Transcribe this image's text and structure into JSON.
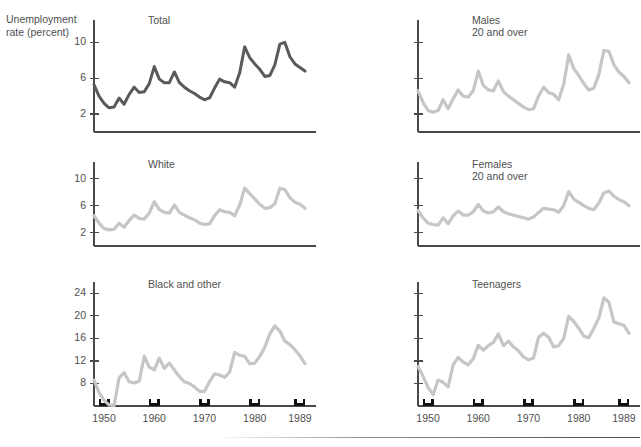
{
  "figure": {
    "axis_label": {
      "line1": "Unemployment",
      "line2": "rate (percent)"
    },
    "line_color_primary": "#5a5a5a",
    "line_color_secondary": "#c6c6c6",
    "axis_color": "#4a4a4a",
    "tick_marker_color": "#111111",
    "x_tick_labels": [
      "1950",
      "1960",
      "1970",
      "1980",
      "1989"
    ],
    "x_tick_years": [
      1950,
      1960,
      1970,
      1980,
      1989
    ]
  },
  "chart_data": [
    {
      "type": "line",
      "title": "Total",
      "xlabel": "",
      "ylabel": "Unemployment rate (percent)",
      "xlim": [
        1948,
        1991
      ],
      "ylim": [
        0,
        12.5
      ],
      "yticks": [
        2,
        6,
        10
      ],
      "ytick_labels": [
        "2",
        "6",
        "10"
      ],
      "xticks": [
        1950,
        1960,
        1970,
        1980,
        1989
      ],
      "xtick_labels": [],
      "grid": false,
      "legend": false,
      "color": "#5a5a5a",
      "x": [
        1948,
        1949,
        1950,
        1951,
        1952,
        1953,
        1954,
        1955,
        1956,
        1957,
        1958,
        1959,
        1960,
        1961,
        1962,
        1963,
        1964,
        1965,
        1966,
        1967,
        1968,
        1969,
        1970,
        1971,
        1972,
        1973,
        1974,
        1975,
        1976,
        1977,
        1978,
        1979,
        1980,
        1981,
        1982,
        1983,
        1984,
        1985,
        1986,
        1987,
        1988,
        1989,
        1990
      ],
      "values": [
        5.3,
        4.0,
        3.2,
        2.7,
        2.8,
        3.8,
        3.1,
        4.2,
        5.0,
        4.4,
        4.5,
        5.4,
        7.3,
        5.9,
        5.5,
        5.5,
        6.7,
        5.5,
        5.0,
        4.6,
        4.3,
        3.9,
        3.6,
        3.8,
        4.9,
        5.9,
        5.6,
        5.5,
        5.0,
        6.6,
        9.5,
        8.3,
        7.6,
        7.0,
        6.2,
        6.3,
        7.5,
        9.8,
        10.0,
        8.4,
        7.6,
        7.2,
        6.8,
        6.3,
        5.8
      ]
    },
    {
      "type": "line",
      "title": "Males\n20 and over",
      "xlabel": "",
      "ylabel": "",
      "xlim": [
        1948,
        1991
      ],
      "ylim": [
        0,
        12.5
      ],
      "yticks": [
        2,
        6,
        10
      ],
      "ytick_labels": [],
      "xticks": [
        1950,
        1960,
        1970,
        1980,
        1989
      ],
      "xtick_labels": [],
      "grid": false,
      "legend": false,
      "color": "#c6c6c6",
      "x": [
        1948,
        1949,
        1950,
        1951,
        1952,
        1953,
        1954,
        1955,
        1956,
        1957,
        1958,
        1959,
        1960,
        1961,
        1962,
        1963,
        1964,
        1965,
        1966,
        1967,
        1968,
        1969,
        1970,
        1971,
        1972,
        1973,
        1974,
        1975,
        1976,
        1977,
        1978,
        1979,
        1980,
        1981,
        1982,
        1983,
        1984,
        1985,
        1986,
        1987,
        1988,
        1989,
        1990
      ],
      "values": [
        4.6,
        3.3,
        2.4,
        2.2,
        2.4,
        3.6,
        2.6,
        3.7,
        4.7,
        4.0,
        3.9,
        4.6,
        6.8,
        5.2,
        4.7,
        4.6,
        5.7,
        4.5,
        4.0,
        3.6,
        3.2,
        2.8,
        2.5,
        2.6,
        4.0,
        5.0,
        4.4,
        4.2,
        3.6,
        5.3,
        8.6,
        7.1,
        6.3,
        5.4,
        4.7,
        4.9,
        6.4,
        9.1,
        9.0,
        7.5,
        6.7,
        6.2,
        5.5,
        5.0,
        4.8
      ]
    },
    {
      "type": "line",
      "title": "White",
      "xlabel": "",
      "ylabel": "",
      "xlim": [
        1948,
        1991
      ],
      "ylim": [
        0,
        12.5
      ],
      "yticks": [
        2,
        6,
        10
      ],
      "ytick_labels": [
        "2",
        "6",
        "10"
      ],
      "xticks": [
        1950,
        1960,
        1970,
        1980,
        1989
      ],
      "xtick_labels": [],
      "grid": false,
      "legend": false,
      "color": "#c6c6c6",
      "x": [
        1948,
        1949,
        1950,
        1951,
        1952,
        1953,
        1954,
        1955,
        1956,
        1957,
        1958,
        1959,
        1960,
        1961,
        1962,
        1963,
        1964,
        1965,
        1966,
        1967,
        1968,
        1969,
        1970,
        1971,
        1972,
        1973,
        1974,
        1975,
        1976,
        1977,
        1978,
        1979,
        1980,
        1981,
        1982,
        1983,
        1984,
        1985,
        1986,
        1987,
        1988,
        1989,
        1990
      ],
      "values": [
        4.5,
        3.4,
        2.6,
        2.4,
        2.5,
        3.4,
        2.8,
        3.8,
        4.6,
        4.1,
        4.0,
        4.9,
        6.6,
        5.4,
        5.0,
        4.9,
        6.1,
        5.0,
        4.6,
        4.2,
        3.9,
        3.4,
        3.2,
        3.3,
        4.5,
        5.4,
        5.1,
        5.0,
        4.5,
        6.1,
        8.6,
        7.8,
        7.0,
        6.2,
        5.6,
        5.7,
        6.3,
        8.6,
        8.4,
        7.2,
        6.5,
        6.2,
        5.6,
        5.3,
        4.7
      ]
    },
    {
      "type": "line",
      "title": "Females\n20 and over",
      "xlabel": "",
      "ylabel": "",
      "xlim": [
        1948,
        1991
      ],
      "ylim": [
        0,
        12.5
      ],
      "yticks": [
        2,
        6,
        10
      ],
      "ytick_labels": [],
      "xticks": [
        1950,
        1960,
        1970,
        1980,
        1989
      ],
      "xtick_labels": [],
      "grid": false,
      "legend": false,
      "color": "#c6c6c6",
      "x": [
        1948,
        1949,
        1950,
        1951,
        1952,
        1953,
        1954,
        1955,
        1956,
        1957,
        1958,
        1959,
        1960,
        1961,
        1962,
        1963,
        1964,
        1965,
        1966,
        1967,
        1968,
        1969,
        1970,
        1971,
        1972,
        1973,
        1974,
        1975,
        1976,
        1977,
        1978,
        1979,
        1980,
        1981,
        1982,
        1983,
        1984,
        1985,
        1986,
        1987,
        1988,
        1989,
        1990
      ],
      "values": [
        5.3,
        4.2,
        3.4,
        3.2,
        3.1,
        4.2,
        3.3,
        4.5,
        5.2,
        4.6,
        4.6,
        5.1,
        6.2,
        5.2,
        4.9,
        5.1,
        5.8,
        5.1,
        4.8,
        4.6,
        4.4,
        4.2,
        4.0,
        4.3,
        5.0,
        5.6,
        5.5,
        5.4,
        5.0,
        6.0,
        8.1,
        7.0,
        6.5,
        6.0,
        5.6,
        5.4,
        6.4,
        7.9,
        8.2,
        7.4,
        6.9,
        6.6,
        6.0,
        5.5,
        5.3
      ]
    },
    {
      "type": "line",
      "title": "Black and other",
      "xlabel": "",
      "ylabel": "",
      "xlim": [
        1948,
        1991
      ],
      "ylim": [
        4,
        26
      ],
      "yticks": [
        8,
        12,
        16,
        20,
        24
      ],
      "ytick_labels": [
        "8",
        "12",
        "16",
        "20",
        "24"
      ],
      "xticks": [
        1950,
        1960,
        1970,
        1980,
        1989
      ],
      "xtick_labels": [
        "1950",
        "1960",
        "1970",
        "1980",
        "1989"
      ],
      "grid": false,
      "legend": false,
      "color": "#c6c6c6",
      "x": [
        1948,
        1949,
        1950,
        1951,
        1952,
        1953,
        1954,
        1955,
        1956,
        1957,
        1958,
        1959,
        1960,
        1961,
        1962,
        1963,
        1964,
        1965,
        1966,
        1967,
        1968,
        1969,
        1970,
        1971,
        1972,
        1973,
        1974,
        1975,
        1976,
        1977,
        1978,
        1979,
        1980,
        1981,
        1982,
        1983,
        1984,
        1985,
        1986,
        1987,
        1988,
        1989,
        1990
      ],
      "values": [
        8.6,
        6.4,
        5.0,
        4.2,
        4.1,
        9.0,
        9.9,
        8.3,
        8.1,
        8.4,
        12.8,
        10.9,
        10.4,
        12.5,
        10.7,
        11.6,
        10.4,
        9.2,
        8.3,
        8.0,
        7.4,
        6.6,
        6.6,
        8.3,
        9.7,
        9.5,
        9.1,
        10.0,
        13.5,
        13.0,
        12.8,
        11.5,
        11.6,
        12.8,
        14.4,
        16.8,
        18.2,
        17.3,
        15.5,
        14.9,
        14.0,
        12.9,
        11.5,
        10.7,
        10.2
      ]
    },
    {
      "type": "line",
      "title": "Teenagers",
      "xlabel": "",
      "ylabel": "",
      "xlim": [
        1948,
        1991
      ],
      "ylim": [
        4,
        26
      ],
      "yticks": [
        8,
        12,
        16,
        20,
        24
      ],
      "ytick_labels": [],
      "xticks": [
        1950,
        1960,
        1970,
        1980,
        1989
      ],
      "xtick_labels": [
        "1950",
        "1960",
        "1970",
        "1980",
        "1989"
      ],
      "grid": false,
      "legend": false,
      "color": "#c6c6c6",
      "x": [
        1948,
        1949,
        1950,
        1951,
        1952,
        1953,
        1954,
        1955,
        1956,
        1957,
        1958,
        1959,
        1960,
        1961,
        1962,
        1963,
        1964,
        1965,
        1966,
        1967,
        1968,
        1969,
        1970,
        1971,
        1972,
        1973,
        1974,
        1975,
        1976,
        1977,
        1978,
        1979,
        1980,
        1981,
        1982,
        1983,
        1984,
        1985,
        1986,
        1987,
        1988,
        1989,
        1990
      ],
      "values": [
        11.0,
        9.3,
        7.3,
        6.0,
        8.6,
        8.2,
        7.4,
        11.3,
        12.6,
        11.8,
        11.3,
        12.4,
        14.8,
        13.9,
        14.7,
        15.3,
        16.8,
        14.7,
        15.5,
        14.5,
        13.8,
        12.7,
        12.2,
        12.5,
        16.2,
        16.9,
        16.2,
        14.5,
        14.7,
        16.0,
        19.9,
        19.0,
        17.8,
        16.4,
        16.1,
        17.8,
        19.6,
        23.2,
        22.4,
        18.9,
        18.6,
        18.3,
        16.9,
        15.3,
        15.0
      ]
    }
  ]
}
